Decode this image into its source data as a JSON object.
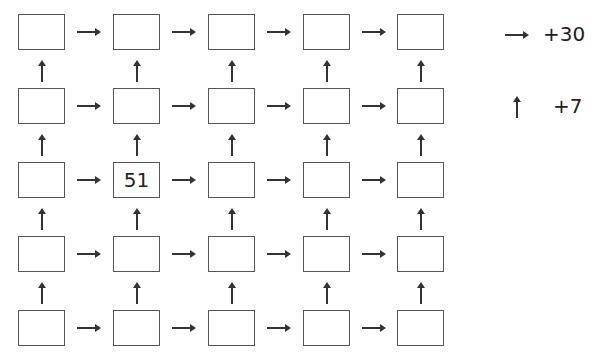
{
  "grid": {
    "rows": 5,
    "cols": 5,
    "cells": [
      [
        "",
        "",
        "",
        "",
        ""
      ],
      [
        "",
        "",
        "",
        "",
        ""
      ],
      [
        "",
        "51",
        "",
        "",
        ""
      ],
      [
        "",
        "",
        "",
        "",
        ""
      ],
      [
        "",
        "",
        "",
        "",
        ""
      ]
    ]
  },
  "legend": {
    "right_arrow": {
      "icon": "right-arrow-icon",
      "label": "+30"
    },
    "up_arrow": {
      "icon": "up-arrow-icon",
      "label": "+7"
    }
  }
}
